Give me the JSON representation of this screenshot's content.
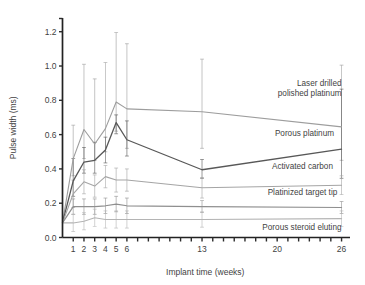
{
  "chart_data": {
    "type": "line",
    "title": "",
    "xlabel": "Implant time (weeks)",
    "ylabel": "Pulse width (ms)",
    "xlim": [
      0,
      26.6
    ],
    "ylim": [
      0.0,
      1.28
    ],
    "grid": false,
    "legend_position": "inline-right",
    "x_tick_values": [
      1,
      2,
      3,
      4,
      5,
      6,
      7,
      8,
      9,
      10,
      11,
      12,
      13,
      14,
      15,
      16,
      17,
      18,
      19,
      20,
      21,
      22,
      23,
      24,
      25,
      26
    ],
    "x_tick_labels": [
      {
        "value": 1,
        "label": "1"
      },
      {
        "value": 2,
        "label": "2"
      },
      {
        "value": 3,
        "label": "3"
      },
      {
        "value": 4,
        "label": "4"
      },
      {
        "value": 5,
        "label": "5"
      },
      {
        "value": 6,
        "label": "6"
      },
      {
        "value": 13,
        "label": "13"
      },
      {
        "value": 20,
        "label": "20"
      },
      {
        "value": 26,
        "label": "26"
      }
    ],
    "y_tick_labels": [
      {
        "value": 0.0,
        "label": "0.0"
      },
      {
        "value": 0.2,
        "label": "0.2"
      },
      {
        "value": 0.4,
        "label": "0.4"
      },
      {
        "value": 0.6,
        "label": "0.6"
      },
      {
        "value": 0.8,
        "label": "0.8"
      },
      {
        "value": 1.0,
        "label": "1.0"
      },
      {
        "value": 1.2,
        "label": "1.2"
      }
    ],
    "x": [
      0,
      1,
      2,
      3,
      4,
      5,
      6,
      13,
      26
    ],
    "series": [
      {
        "name": "Laser drilled polished platinum",
        "color": "#9d9d9d",
        "width": 1.1,
        "values": [
          0.085,
          0.46,
          0.63,
          0.545,
          0.635,
          0.79,
          0.75,
          0.733,
          0.645
        ],
        "errors_high": [
          null,
          0.655,
          1.01,
          0.925,
          1.02,
          1.195,
          1.13,
          1.04,
          1.005
        ],
        "errors_low": [
          null,
          0.36,
          0.46,
          0.45,
          0.5,
          0.62,
          0.52,
          0.52,
          0.45
        ]
      },
      {
        "name": "Porous platinum",
        "color": "#585858",
        "width": 1.3,
        "values": [
          0.085,
          0.33,
          0.44,
          0.45,
          0.51,
          0.67,
          0.57,
          0.395,
          0.515
        ],
        "errors_high": [
          null,
          0.46,
          0.525,
          0.555,
          0.585,
          0.715,
          0.68,
          0.455,
          0.865
        ],
        "errors_low": [
          null,
          0.24,
          0.375,
          0.375,
          0.435,
          0.605,
          0.475,
          0.345,
          0.345
        ]
      },
      {
        "name": "Activated carbon",
        "color": "#a5a5a5",
        "width": 1.1,
        "values": [
          0.085,
          0.255,
          0.325,
          0.3,
          0.355,
          0.335,
          0.335,
          0.29,
          0.305
        ],
        "errors_high": [
          null,
          0.335,
          0.395,
          0.365,
          0.42,
          0.405,
          0.4,
          0.35,
          0.36
        ],
        "errors_low": [
          null,
          0.175,
          0.255,
          0.235,
          0.29,
          0.265,
          0.27,
          0.23,
          0.25
        ]
      },
      {
        "name": "Platinized target tip",
        "color": "#8f8f8f",
        "width": 1.2,
        "values": [
          0.085,
          0.18,
          0.18,
          0.18,
          0.185,
          0.195,
          0.185,
          0.18,
          0.175
        ],
        "errors_high": [
          null,
          0.225,
          0.225,
          0.225,
          0.23,
          0.24,
          0.23,
          0.215,
          0.21
        ],
        "errors_low": [
          null,
          0.135,
          0.135,
          0.135,
          0.14,
          0.15,
          0.14,
          0.145,
          0.14
        ]
      },
      {
        "name": "Porous steroid eluting",
        "color": "#b4b4b4",
        "width": 1.1,
        "values": [
          0.085,
          0.085,
          0.095,
          0.115,
          0.105,
          0.105,
          0.105,
          0.105,
          0.11
        ],
        "errors_high": [
          null,
          0.135,
          0.145,
          0.165,
          0.155,
          0.155,
          0.155,
          0.15,
          0.155
        ],
        "errors_low": [
          null,
          0.035,
          0.045,
          0.065,
          0.055,
          0.055,
          0.055,
          0.06,
          0.065
        ]
      }
    ],
    "series_labels": [
      {
        "name": "Laser drilled polished platinum",
        "lines": [
          "Laser drilled",
          "polished platinum"
        ],
        "x": 26.0,
        "y": 0.885
      },
      {
        "name": "Porous platinum",
        "lines": [
          "Porous platinum"
        ],
        "x": 25.3,
        "y": 0.59
      },
      {
        "name": "Activated carbon",
        "lines": [
          "Activated carbon"
        ],
        "x": 25.2,
        "y": 0.4
      },
      {
        "name": "Platinized target tip",
        "lines": [
          "Platinized target tip"
        ],
        "x": 25.6,
        "y": 0.245
      },
      {
        "name": "Porous steroid eluting",
        "lines": [
          "Porous steroid eluting"
        ],
        "x": 26.0,
        "y": 0.045
      }
    ]
  },
  "figure": {
    "axis_color": "#222222",
    "tick_color": "#2b2b2b",
    "background": "#ffffff"
  }
}
